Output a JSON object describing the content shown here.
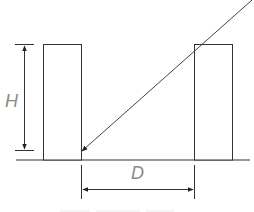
{
  "diagram": {
    "labels": {
      "height": "H",
      "distance": "D"
    },
    "elements": {
      "ground_line": {
        "x1": 16,
        "y1": 160,
        "x2": 250,
        "y2": 160
      },
      "left_building": {
        "x": 43,
        "y": 44,
        "width": 38,
        "height": 116
      },
      "right_building": {
        "x": 194,
        "y": 44,
        "width": 38,
        "height": 116
      },
      "sight_line": {
        "x1": 250,
        "y1": 0,
        "x2": 81,
        "y2": 151
      },
      "height_dimension": {
        "x": 24,
        "y_top": 44,
        "y_bottom": 150
      },
      "distance_dimension": {
        "y": 189,
        "x_left": 81,
        "x_right": 194
      }
    },
    "colors": {
      "stroke": "#333333",
      "label": "#8a8a8a",
      "background": "#ffffff"
    }
  }
}
